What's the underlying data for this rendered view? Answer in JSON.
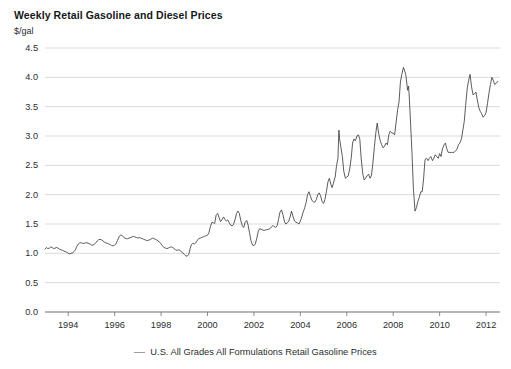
{
  "chart_data": {
    "type": "line",
    "title": "Weekly Retail Gasoline and Diesel Prices",
    "xlabel": "",
    "ylabel": "$/gal",
    "ylim": [
      0.0,
      4.5
    ],
    "xlim": [
      1993.0,
      2012.6
    ],
    "grid": true,
    "legend_position": "bottom",
    "y_ticks": [
      "0.0",
      "0.5",
      "1.0",
      "1.5",
      "2.0",
      "2.5",
      "3.0",
      "3.5",
      "4.0",
      "4.5"
    ],
    "y_tick_values": [
      0.0,
      0.5,
      1.0,
      1.5,
      2.0,
      2.5,
      3.0,
      3.5,
      4.0,
      4.5
    ],
    "x_ticks": [
      "1994",
      "1996",
      "1998",
      "2000",
      "2002",
      "2004",
      "2006",
      "2008",
      "2010",
      "2012"
    ],
    "x_tick_values": [
      1994,
      1996,
      1998,
      2000,
      2002,
      2004,
      2006,
      2008,
      2010,
      2012
    ],
    "series": [
      {
        "name": "U.S. All Grades All Formulations Retail Gasoline Prices",
        "color": "#3c3f42",
        "x": [
          1993.0,
          1993.06,
          1993.12,
          1993.19,
          1993.25,
          1993.31,
          1993.37,
          1993.44,
          1993.5,
          1993.56,
          1993.62,
          1993.69,
          1993.75,
          1993.81,
          1993.87,
          1993.94,
          1994.0,
          1994.06,
          1994.12,
          1994.19,
          1994.25,
          1994.31,
          1994.37,
          1994.44,
          1994.5,
          1994.56,
          1994.62,
          1994.69,
          1994.75,
          1994.81,
          1994.87,
          1994.94,
          1995.0,
          1995.06,
          1995.12,
          1995.19,
          1995.25,
          1995.31,
          1995.37,
          1995.44,
          1995.5,
          1995.56,
          1995.62,
          1995.69,
          1995.75,
          1995.81,
          1995.87,
          1995.94,
          1996.0,
          1996.06,
          1996.12,
          1996.19,
          1996.25,
          1996.31,
          1996.37,
          1996.44,
          1996.5,
          1996.56,
          1996.62,
          1996.69,
          1996.75,
          1996.81,
          1996.87,
          1996.94,
          1997.0,
          1997.06,
          1997.12,
          1997.19,
          1997.25,
          1997.31,
          1997.37,
          1997.44,
          1997.5,
          1997.56,
          1997.62,
          1997.69,
          1997.75,
          1997.81,
          1997.87,
          1997.94,
          1998.0,
          1998.06,
          1998.12,
          1998.19,
          1998.25,
          1998.31,
          1998.37,
          1998.44,
          1998.5,
          1998.56,
          1998.62,
          1998.69,
          1998.75,
          1998.81,
          1998.87,
          1998.94,
          1999.0,
          1999.06,
          1999.12,
          1999.19,
          1999.25,
          1999.31,
          1999.37,
          1999.44,
          1999.5,
          1999.56,
          1999.62,
          1999.69,
          1999.75,
          1999.81,
          1999.87,
          1999.94,
          2000.0,
          2000.06,
          2000.12,
          2000.19,
          2000.25,
          2000.31,
          2000.37,
          2000.44,
          2000.5,
          2000.56,
          2000.62,
          2000.69,
          2000.75,
          2000.81,
          2000.87,
          2000.94,
          2001.0,
          2001.06,
          2001.12,
          2001.19,
          2001.25,
          2001.31,
          2001.37,
          2001.44,
          2001.5,
          2001.56,
          2001.62,
          2001.69,
          2001.75,
          2001.81,
          2001.87,
          2001.94,
          2002.0,
          2002.06,
          2002.12,
          2002.19,
          2002.25,
          2002.31,
          2002.37,
          2002.44,
          2002.5,
          2002.56,
          2002.62,
          2002.69,
          2002.75,
          2002.81,
          2002.87,
          2002.94,
          2003.0,
          2003.06,
          2003.12,
          2003.19,
          2003.25,
          2003.31,
          2003.37,
          2003.44,
          2003.5,
          2003.56,
          2003.62,
          2003.69,
          2003.75,
          2003.81,
          2003.87,
          2003.94,
          2004.0,
          2004.06,
          2004.12,
          2004.19,
          2004.25,
          2004.31,
          2004.37,
          2004.44,
          2004.5,
          2004.56,
          2004.62,
          2004.69,
          2004.75,
          2004.81,
          2004.87,
          2004.94,
          2005.0,
          2005.06,
          2005.12,
          2005.19,
          2005.25,
          2005.31,
          2005.37,
          2005.44,
          2005.5,
          2005.56,
          2005.62,
          2005.66,
          2005.69,
          2005.75,
          2005.81,
          2005.87,
          2005.94,
          2006.0,
          2006.06,
          2006.12,
          2006.19,
          2006.25,
          2006.31,
          2006.37,
          2006.44,
          2006.5,
          2006.56,
          2006.62,
          2006.69,
          2006.75,
          2006.81,
          2006.87,
          2006.94,
          2007.0,
          2007.06,
          2007.12,
          2007.19,
          2007.25,
          2007.31,
          2007.37,
          2007.44,
          2007.5,
          2007.56,
          2007.62,
          2007.69,
          2007.75,
          2007.81,
          2007.87,
          2007.94,
          2008.0,
          2008.06,
          2008.12,
          2008.19,
          2008.25,
          2008.31,
          2008.37,
          2008.44,
          2008.5,
          2008.54,
          2008.58,
          2008.62,
          2008.66,
          2008.69,
          2008.75,
          2008.81,
          2008.87,
          2008.94,
          2009.0,
          2009.06,
          2009.12,
          2009.19,
          2009.25,
          2009.31,
          2009.37,
          2009.44,
          2009.5,
          2009.56,
          2009.62,
          2009.69,
          2009.75,
          2009.81,
          2009.87,
          2009.94,
          2010.0,
          2010.06,
          2010.12,
          2010.19,
          2010.25,
          2010.31,
          2010.37,
          2010.44,
          2010.5,
          2010.56,
          2010.62,
          2010.69,
          2010.75,
          2010.81,
          2010.87,
          2010.94,
          2011.0,
          2011.06,
          2011.12,
          2011.19,
          2011.25,
          2011.31,
          2011.37,
          2011.44,
          2011.5,
          2011.56,
          2011.62,
          2011.69,
          2011.75,
          2011.81,
          2011.87,
          2011.94,
          2012.0,
          2012.06,
          2012.12,
          2012.19,
          2012.25,
          2012.31,
          2012.37,
          2012.44,
          2012.5
        ],
        "y": [
          1.07,
          1.1,
          1.08,
          1.09,
          1.11,
          1.1,
          1.08,
          1.09,
          1.1,
          1.09,
          1.07,
          1.06,
          1.05,
          1.04,
          1.03,
          1.02,
          1.0,
          0.99,
          1.0,
          1.01,
          1.03,
          1.06,
          1.12,
          1.16,
          1.18,
          1.18,
          1.17,
          1.17,
          1.18,
          1.18,
          1.17,
          1.16,
          1.14,
          1.14,
          1.15,
          1.18,
          1.21,
          1.23,
          1.24,
          1.23,
          1.21,
          1.19,
          1.18,
          1.17,
          1.16,
          1.15,
          1.13,
          1.13,
          1.14,
          1.16,
          1.22,
          1.28,
          1.31,
          1.31,
          1.28,
          1.26,
          1.25,
          1.25,
          1.26,
          1.27,
          1.28,
          1.29,
          1.28,
          1.27,
          1.26,
          1.27,
          1.26,
          1.25,
          1.24,
          1.23,
          1.22,
          1.22,
          1.23,
          1.24,
          1.26,
          1.25,
          1.24,
          1.23,
          1.21,
          1.19,
          1.16,
          1.13,
          1.1,
          1.09,
          1.08,
          1.09,
          1.1,
          1.11,
          1.1,
          1.08,
          1.06,
          1.05,
          1.06,
          1.05,
          1.03,
          1.01,
          0.98,
          0.96,
          0.95,
          0.98,
          1.08,
          1.15,
          1.17,
          1.16,
          1.18,
          1.22,
          1.25,
          1.26,
          1.27,
          1.28,
          1.29,
          1.3,
          1.31,
          1.35,
          1.45,
          1.53,
          1.52,
          1.51,
          1.65,
          1.68,
          1.61,
          1.54,
          1.57,
          1.62,
          1.58,
          1.55,
          1.57,
          1.52,
          1.48,
          1.47,
          1.49,
          1.58,
          1.68,
          1.72,
          1.68,
          1.55,
          1.47,
          1.44,
          1.53,
          1.56,
          1.48,
          1.35,
          1.22,
          1.14,
          1.13,
          1.16,
          1.25,
          1.38,
          1.42,
          1.41,
          1.4,
          1.39,
          1.4,
          1.4,
          1.41,
          1.42,
          1.45,
          1.47,
          1.46,
          1.44,
          1.47,
          1.58,
          1.7,
          1.74,
          1.66,
          1.55,
          1.5,
          1.52,
          1.55,
          1.62,
          1.72,
          1.62,
          1.55,
          1.53,
          1.52,
          1.5,
          1.55,
          1.62,
          1.7,
          1.78,
          1.87,
          2.0,
          2.05,
          1.97,
          1.9,
          1.88,
          1.87,
          1.92,
          2.0,
          2.03,
          1.98,
          1.88,
          1.85,
          1.92,
          2.05,
          2.22,
          2.28,
          2.18,
          2.12,
          2.22,
          2.3,
          2.5,
          2.62,
          3.1,
          2.95,
          2.8,
          2.65,
          2.4,
          2.28,
          2.3,
          2.32,
          2.42,
          2.62,
          2.88,
          2.95,
          2.92,
          3.0,
          3.02,
          2.95,
          2.62,
          2.35,
          2.25,
          2.28,
          2.32,
          2.35,
          2.28,
          2.32,
          2.52,
          2.82,
          3.05,
          3.22,
          3.05,
          2.92,
          2.85,
          2.8,
          2.82,
          2.88,
          2.85,
          3.02,
          3.08,
          3.05,
          3.05,
          3.02,
          3.22,
          3.45,
          3.58,
          3.92,
          4.05,
          4.17,
          4.1,
          4.05,
          3.92,
          3.78,
          3.85,
          3.68,
          3.2,
          2.7,
          2.1,
          1.72,
          1.78,
          1.88,
          1.95,
          2.05,
          2.05,
          2.28,
          2.6,
          2.62,
          2.58,
          2.62,
          2.65,
          2.58,
          2.62,
          2.68,
          2.65,
          2.62,
          2.7,
          2.65,
          2.78,
          2.85,
          2.88,
          2.78,
          2.72,
          2.72,
          2.72,
          2.72,
          2.72,
          2.75,
          2.78,
          2.85,
          2.88,
          2.95,
          3.1,
          3.25,
          3.52,
          3.82,
          3.95,
          4.05,
          3.85,
          3.7,
          3.72,
          3.75,
          3.62,
          3.48,
          3.42,
          3.38,
          3.32,
          3.35,
          3.4,
          3.55,
          3.72,
          3.88,
          4.0,
          3.95,
          3.88,
          3.9,
          3.93
        ]
      }
    ]
  },
  "legend": {
    "label": "U.S. All Grades All Formulations Retail Gasoline Prices"
  }
}
